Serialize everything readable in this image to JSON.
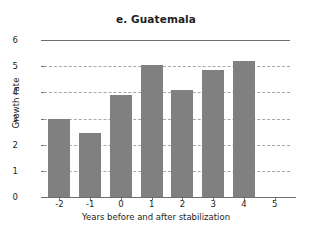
{
  "chart_data": {
    "type": "bar",
    "title": "e. Guatemala",
    "xlabel": "Years before and after stabilization",
    "ylabel": "Growth rate",
    "categories": [
      "-2",
      "-1",
      "0",
      "1",
      "2",
      "3",
      "4",
      "5"
    ],
    "values": [
      3.0,
      2.45,
      3.9,
      5.05,
      4.1,
      4.85,
      5.2,
      null
    ],
    "ylim": [
      0,
      6
    ],
    "yticks": [
      "0",
      "1",
      "2",
      "3",
      "4",
      "5",
      "6"
    ],
    "xticks": [
      "-2",
      "-1",
      "0",
      "1",
      "2",
      "3",
      "4",
      "5"
    ],
    "grid": true,
    "grid_style": "dashed-horizontal",
    "legend": null,
    "bar_color": "#808080",
    "axis_color": "#6d6d6d",
    "grid_color": "#a8a8a8",
    "background": "#ffffff"
  }
}
